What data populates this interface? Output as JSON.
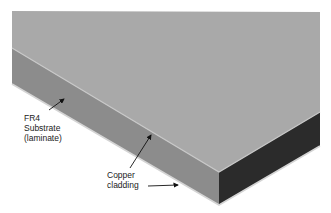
{
  "diagram": {
    "labels": {
      "substrate_line1": "FR4",
      "substrate_line2": "Substrate",
      "substrate_line3": "(laminate)",
      "cladding_line1": "Copper",
      "cladding_line2": "cladding"
    },
    "colors": {
      "top_face": "#a9a9a9",
      "front_face": "#8f8f8f",
      "side_face": "#2b2b2b",
      "edge_highlight": "#d0d0d0",
      "arrow": "#111111",
      "text": "#222222"
    }
  }
}
